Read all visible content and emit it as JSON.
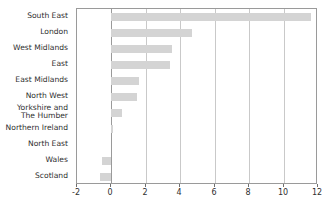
{
  "chart_data": {
    "type": "bar",
    "orientation": "horizontal",
    "title": "",
    "subtitle": "",
    "xlabel": "",
    "ylabel": "",
    "xlim": [
      -2,
      12
    ],
    "ylim": null,
    "grid": true,
    "legend": null,
    "bar_color": "#d4d4d4",
    "axis_color": "#9a9a9a",
    "gridline_color": "#c9c9c9",
    "xticks": [
      -2,
      0,
      2,
      4,
      6,
      8,
      10,
      12
    ],
    "xtick_labels": [
      "-2",
      "0",
      "2",
      "4",
      "6",
      "8",
      "10",
      "12"
    ],
    "categories": [
      "South East",
      "London",
      "West Midlands",
      "East",
      "East Midlands",
      "North West",
      "Yorkshire and\nThe Humber",
      "Northern Ireland",
      "North East",
      "Wales",
      "Scotland"
    ],
    "values": [
      11.6,
      4.7,
      3.5,
      3.4,
      1.6,
      1.5,
      0.6,
      0.1,
      0.0,
      -0.55,
      -0.65
    ]
  }
}
